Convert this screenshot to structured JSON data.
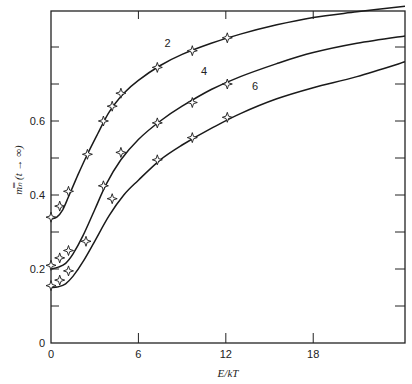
{
  "chart_data": {
    "type": "line",
    "title": "",
    "xlabel": "E/kT",
    "ylabel": "m̿ₙ (t → ∞)",
    "xlim": [
      0,
      24.3
    ],
    "ylim": [
      0,
      0.9
    ],
    "x_ticks": [
      0,
      6,
      12,
      18
    ],
    "x_tick_labels": [
      "0",
      "6",
      "12",
      "18"
    ],
    "y_ticks": [
      0,
      0.1,
      0.2,
      0.3,
      0.4,
      0.5,
      0.6,
      0.7,
      0.8,
      0.9
    ],
    "y_tick_labels": [
      "0",
      "",
      "0.2",
      "",
      "0.4",
      "",
      "0.6",
      "",
      "",
      ""
    ],
    "grid": false,
    "legend": "inline curve labels",
    "series": [
      {
        "name": "2",
        "curve": [
          [
            0,
            0.335
          ],
          [
            0.4,
            0.34
          ],
          [
            0.8,
            0.36
          ],
          [
            1.2,
            0.395
          ],
          [
            1.8,
            0.45
          ],
          [
            2.5,
            0.51
          ],
          [
            3.2,
            0.565
          ],
          [
            4.0,
            0.625
          ],
          [
            5.0,
            0.675
          ],
          [
            6.0,
            0.71
          ],
          [
            7.5,
            0.75
          ],
          [
            9.0,
            0.78
          ],
          [
            11.0,
            0.81
          ],
          [
            13.0,
            0.835
          ],
          [
            15.5,
            0.86
          ],
          [
            18.0,
            0.88
          ],
          [
            21.0,
            0.895
          ],
          [
            24.3,
            0.91
          ]
        ],
        "points": [
          [
            0,
            0.34
          ],
          [
            0.6,
            0.37
          ],
          [
            1.2,
            0.41
          ],
          [
            2.5,
            0.51
          ],
          [
            3.6,
            0.6
          ],
          [
            4.2,
            0.64
          ],
          [
            4.8,
            0.675
          ],
          [
            7.3,
            0.745
          ],
          [
            9.7,
            0.79
          ],
          [
            12.1,
            0.825
          ]
        ],
        "label_pos": [
          8.0,
          0.8
        ]
      },
      {
        "name": "4",
        "curve": [
          [
            0,
            0.2
          ],
          [
            0.5,
            0.205
          ],
          [
            1.0,
            0.215
          ],
          [
            1.5,
            0.24
          ],
          [
            2.2,
            0.29
          ],
          [
            3.0,
            0.36
          ],
          [
            3.8,
            0.43
          ],
          [
            4.8,
            0.495
          ],
          [
            6.0,
            0.55
          ],
          [
            7.5,
            0.6
          ],
          [
            9.0,
            0.64
          ],
          [
            11.0,
            0.685
          ],
          [
            13.0,
            0.72
          ],
          [
            15.5,
            0.755
          ],
          [
            18.0,
            0.785
          ],
          [
            21.0,
            0.81
          ],
          [
            24.3,
            0.83
          ]
        ],
        "points": [
          [
            0,
            0.21
          ],
          [
            0.6,
            0.23
          ],
          [
            1.2,
            0.25
          ],
          [
            3.6,
            0.425
          ],
          [
            4.8,
            0.515
          ],
          [
            7.3,
            0.595
          ],
          [
            9.7,
            0.65
          ],
          [
            12.1,
            0.7
          ]
        ],
        "label_pos": [
          10.5,
          0.725
        ]
      },
      {
        "name": "6",
        "curve": [
          [
            0,
            0.15
          ],
          [
            0.5,
            0.152
          ],
          [
            1.0,
            0.16
          ],
          [
            1.5,
            0.18
          ],
          [
            2.2,
            0.22
          ],
          [
            3.0,
            0.275
          ],
          [
            4.0,
            0.345
          ],
          [
            5.0,
            0.4
          ],
          [
            6.0,
            0.44
          ],
          [
            7.5,
            0.495
          ],
          [
            9.0,
            0.535
          ],
          [
            11.0,
            0.58
          ],
          [
            13.0,
            0.62
          ],
          [
            15.5,
            0.66
          ],
          [
            18.0,
            0.69
          ],
          [
            21.0,
            0.72
          ],
          [
            24.3,
            0.76
          ]
        ],
        "points": [
          [
            0,
            0.155
          ],
          [
            0.6,
            0.17
          ],
          [
            1.2,
            0.195
          ],
          [
            2.4,
            0.275
          ],
          [
            4.2,
            0.39
          ],
          [
            7.3,
            0.495
          ],
          [
            9.7,
            0.555
          ],
          [
            12.1,
            0.61
          ]
        ],
        "label_pos": [
          14.0,
          0.685
        ]
      }
    ]
  },
  "axes": {
    "x_title": "E/kT",
    "y_title": "m̿ₙ (t → ∞)"
  }
}
